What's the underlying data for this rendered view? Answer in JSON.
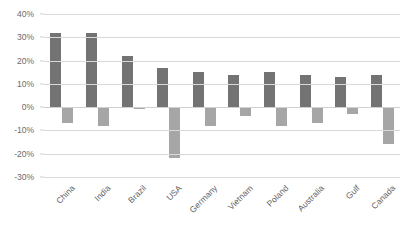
{
  "chart_data": {
    "type": "bar",
    "title": "",
    "subtitle": "",
    "xlabel": "",
    "ylabel": "",
    "ylim": [
      -30,
      40
    ],
    "ytick_labels": [
      "40%",
      "30%",
      "20%",
      "10%",
      "0%",
      "-10%",
      "-20%",
      "-30%"
    ],
    "ytick_values": [
      40,
      30,
      20,
      10,
      0,
      -10,
      -20,
      -30
    ],
    "grid": true,
    "legend": "none",
    "value_unit": "%",
    "categories": [
      "China",
      "India",
      "Brazil",
      "USA",
      "Germany",
      "Vietnam",
      "Poland",
      "Australia",
      "Gulf",
      "Canada"
    ],
    "series": [
      {
        "name": "positive",
        "color": "#737373",
        "values": [
          32,
          32,
          22,
          17,
          15,
          14,
          15,
          14,
          13,
          14
        ]
      },
      {
        "name": "negative",
        "color": "#a6a6a6",
        "values": [
          -7,
          -8,
          -1,
          -22,
          -8,
          -4,
          -8,
          -7,
          -3,
          -16
        ]
      }
    ]
  },
  "style": {
    "background": "#ffffff",
    "gridline_color": "#d9d9d9",
    "axis_label_color": "#6b6b6b",
    "category_label_color": "#5f5f5f"
  }
}
